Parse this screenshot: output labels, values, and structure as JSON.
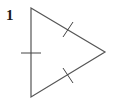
{
  "figure": {
    "label": "1",
    "shape": "equilateral triangle",
    "vertices": [
      [
        31,
        8
      ],
      [
        105,
        52
      ],
      [
        31,
        97
      ]
    ],
    "tick_marks": [
      {
        "side": "left",
        "from": [
          21,
          53
        ],
        "to": [
          41,
          53
        ]
      },
      {
        "side": "upper-right",
        "from": [
          63,
          37
        ],
        "to": [
          73,
          22
        ]
      },
      {
        "side": "lower-right",
        "from": [
          63,
          68
        ],
        "to": [
          73,
          83
        ]
      }
    ],
    "stroke_color": "#555555",
    "tick_color": "#444444"
  }
}
